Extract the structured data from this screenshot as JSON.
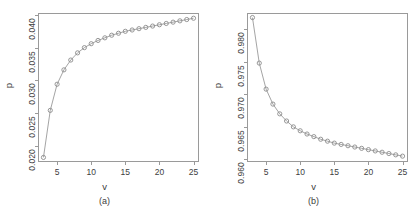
{
  "figure": {
    "background": "#ffffff",
    "marker_color": "#8c8c8c",
    "line_color": "#9a9a9a",
    "axis_color": "#9a9a9a",
    "text_color": "#3d3d3d"
  },
  "panels": [
    {
      "id": "a",
      "caption": "(a)",
      "xlabel": "v",
      "ylabel": "p",
      "x_ticks": [
        "5",
        "10",
        "15",
        "20",
        "25"
      ],
      "y_ticks": [
        "0.020",
        "0.025",
        "0.030",
        "0.035",
        "0.040"
      ]
    },
    {
      "id": "b",
      "caption": "(b)",
      "xlabel": "v",
      "ylabel": "p",
      "x_ticks": [
        "5",
        "10",
        "15",
        "20",
        "25"
      ],
      "y_ticks": [
        "0.960",
        "0.965",
        "0.970",
        "0.975",
        "0.980"
      ]
    }
  ],
  "chart_data": [
    {
      "type": "line",
      "panel": "a",
      "title": "",
      "subtitle": "",
      "caption": "(a)",
      "xlabel": "v",
      "ylabel": "p",
      "xlim": [
        2.2,
        25.8
      ],
      "ylim": [
        0.0175,
        0.0403
      ],
      "x_ticks": [
        5,
        10,
        15,
        20,
        25
      ],
      "y_ticks": [
        0.02,
        0.025,
        0.03,
        0.035,
        0.04
      ],
      "grid": false,
      "legend": null,
      "marker": "open-circle",
      "x": [
        3,
        4,
        5,
        6,
        7,
        8,
        9,
        10,
        11,
        12,
        13,
        14,
        15,
        16,
        17,
        18,
        19,
        20,
        21,
        22,
        23,
        24,
        25
      ],
      "values": [
        0.0182,
        0.0254,
        0.0294,
        0.0316,
        0.0331,
        0.0342,
        0.035,
        0.0356,
        0.0361,
        0.0365,
        0.0369,
        0.0372,
        0.0375,
        0.0377,
        0.0379,
        0.0381,
        0.0383,
        0.0385,
        0.0387,
        0.0389,
        0.0391,
        0.0393,
        0.0395
      ]
    },
    {
      "type": "line",
      "panel": "b",
      "title": "",
      "subtitle": "",
      "caption": "(b)",
      "xlabel": "v",
      "ylabel": "p",
      "xlim": [
        2.2,
        25.8
      ],
      "ylim": [
        0.9596,
        0.9825
      ],
      "x_ticks": [
        5,
        10,
        15,
        20,
        25
      ],
      "y_ticks": [
        0.96,
        0.965,
        0.97,
        0.975,
        0.98
      ],
      "grid": false,
      "legend": null,
      "marker": "open-circle",
      "x": [
        3,
        4,
        5,
        6,
        7,
        8,
        9,
        10,
        11,
        12,
        13,
        14,
        15,
        16,
        17,
        18,
        19,
        20,
        21,
        22,
        23,
        24,
        25
      ],
      "values": [
        0.9818,
        0.9748,
        0.9708,
        0.9685,
        0.967,
        0.9659,
        0.965,
        0.9644,
        0.9639,
        0.9635,
        0.9631,
        0.9628,
        0.9625,
        0.9623,
        0.9621,
        0.9619,
        0.9617,
        0.9615,
        0.9613,
        0.9611,
        0.9609,
        0.9607,
        0.9605
      ]
    }
  ]
}
